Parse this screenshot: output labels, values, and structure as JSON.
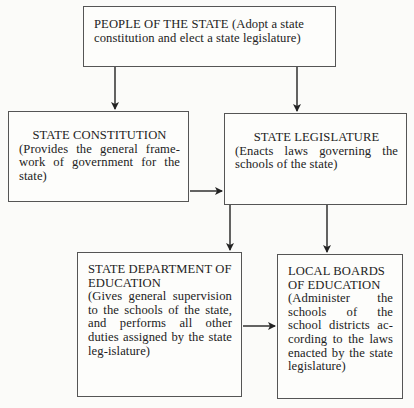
{
  "diagram": {
    "type": "flowchart",
    "nodes": [
      {
        "id": "people",
        "title": "PEOPLE OF THE STATE",
        "description": "(Adopt a state constitution and elect a state legislature)"
      },
      {
        "id": "constitution",
        "title": "STATE CONSTITUTION",
        "description": "(Provides the general frame-work of government for the state)"
      },
      {
        "id": "legislature",
        "title": "STATE LEGISLATURE",
        "description": "(Enacts laws governing the schools of the state)"
      },
      {
        "id": "department",
        "title": "STATE DEPARTMENT OF EDUCATION",
        "description": "(Gives general supervision to the schools of the state, and performs all other duties assigned by the state leg-islature)"
      },
      {
        "id": "local",
        "title": "LOCAL BOARDS OF EDUCATION",
        "description": "(Administer the schools of the school districts ac-cording to the laws enacted by the state legislature)"
      }
    ],
    "edges": [
      {
        "from": "people",
        "to": "constitution"
      },
      {
        "from": "people",
        "to": "legislature"
      },
      {
        "from": "constitution",
        "to": "legislature"
      },
      {
        "from": "legislature",
        "to": "department"
      },
      {
        "from": "legislature",
        "to": "local"
      },
      {
        "from": "department",
        "to": "local"
      }
    ],
    "colors": {
      "line": "#222222",
      "border": "#555555",
      "background": "#fbfbf9"
    }
  }
}
